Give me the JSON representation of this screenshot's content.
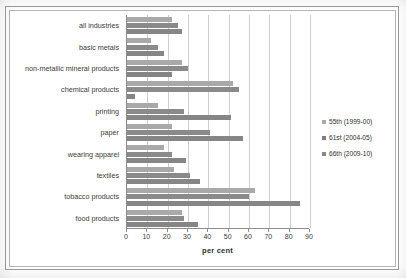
{
  "chart_data": {
    "type": "bar",
    "orientation": "horizontal",
    "title": "",
    "xlabel": "per cent",
    "ylabel": "",
    "xlim": [
      0,
      90
    ],
    "xticks": [
      0,
      10,
      20,
      30,
      40,
      50,
      60,
      70,
      80,
      90
    ],
    "xticklabels": [
      "0",
      "10",
      "20",
      "30",
      "40",
      "50",
      "60",
      "70",
      "80",
      "90"
    ],
    "grid": true,
    "grid_axis": "x",
    "legend_position": "right",
    "categories": [
      "all industries",
      "basic metals",
      "non-metallic mineral products",
      "chemical products",
      "printing",
      "paper",
      "wearing apparel",
      "textiles",
      "tobacco products",
      "food products"
    ],
    "series": [
      {
        "name": "55th (1999-00)",
        "color": "#a9a9a9",
        "values": [
          22,
          12,
          27,
          52,
          15,
          22,
          18,
          23,
          63,
          27
        ]
      },
      {
        "name": "61st (2004-05)",
        "color": "#7f7f7f",
        "values": [
          25,
          15,
          30,
          55,
          28,
          41,
          22,
          31,
          60,
          28
        ]
      },
      {
        "name": "66th (2009-10)",
        "color": "#8a8a8a",
        "values": [
          27,
          18,
          22,
          4,
          51,
          57,
          29,
          36,
          85,
          35
        ]
      }
    ]
  },
  "legend": {
    "items": [
      {
        "label": "55th (1999-00)",
        "swatch": "legend-swatch-55th"
      },
      {
        "label": "61st (2004-05)",
        "swatch": "legend-swatch-61st"
      },
      {
        "label": "66th (2009-10)",
        "swatch": "legend-swatch-66th"
      }
    ]
  },
  "axis": {
    "x_title": "per cent"
  },
  "colors": {
    "series_55th": "#a9a9a9",
    "series_61st": "#7f7f7f",
    "series_66th": "#8a8a8a",
    "gridline": "#cfcfcf",
    "axis": "#8c8c8c",
    "frame": "#9a9a9a",
    "text": "#3a3a3a"
  }
}
